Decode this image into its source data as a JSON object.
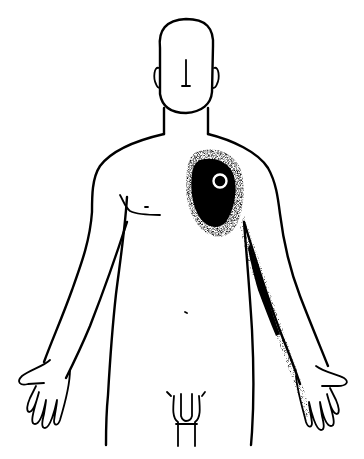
{
  "figure": {
    "description": "Referred pain pattern diagram",
    "trigger_point": {
      "label": "Trigger point",
      "location": "left upper chest (viewer's right), pectoral region",
      "marker": "white ring"
    },
    "pain_zones": [
      {
        "name": "chest-zone",
        "intensity": "dense",
        "location": "pectoral region around trigger point"
      },
      {
        "name": "arm-zone",
        "intensity": "dense to sparse",
        "location": "inner (ulnar) side of arm down to ring and little fingers"
      }
    ],
    "colors": {
      "line": "#000000",
      "background": "#ffffff",
      "stipple": "#000000"
    }
  }
}
